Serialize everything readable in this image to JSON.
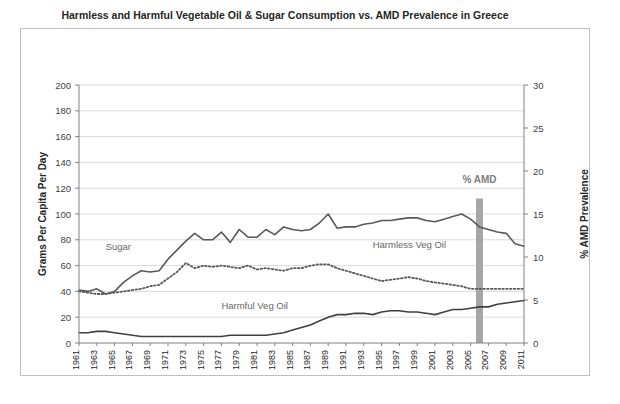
{
  "chart_data": {
    "type": "line",
    "title": "Harmless and Harmful Vegetable Oil & Sugar Consumption vs. AMD Prevalence in Greece",
    "xlabel": "",
    "ylabel": "Grams Per Capita Per Day",
    "y2label": "% AMD Prevalence",
    "ylim": [
      0,
      200
    ],
    "y2lim": [
      0,
      30
    ],
    "yticks": [
      0,
      20,
      40,
      60,
      80,
      100,
      120,
      140,
      160,
      180,
      200
    ],
    "y2ticks": [
      0,
      5,
      10,
      15,
      20,
      25,
      30
    ],
    "grid": true,
    "legend_position": "inline-annotations",
    "x": [
      1961,
      1962,
      1963,
      1964,
      1965,
      1966,
      1967,
      1968,
      1969,
      1970,
      1971,
      1972,
      1973,
      1974,
      1975,
      1976,
      1977,
      1978,
      1979,
      1980,
      1981,
      1982,
      1983,
      1984,
      1985,
      1986,
      1987,
      1988,
      1989,
      1990,
      1991,
      1992,
      1993,
      1994,
      1995,
      1996,
      1997,
      1998,
      1999,
      2000,
      2001,
      2002,
      2003,
      2004,
      2005,
      2006,
      2007,
      2008,
      2009,
      2010,
      2011
    ],
    "xtick_labels": [
      "1961",
      "1963",
      "1965",
      "1967",
      "1969",
      "1971",
      "1973",
      "1975",
      "1977",
      "1979",
      "1981",
      "1983",
      "1985",
      "1987",
      "1989",
      "1991",
      "1993",
      "1995",
      "1997",
      "1999",
      "2001",
      "2003",
      "2005",
      "2007",
      "2009",
      "2011"
    ],
    "series": [
      {
        "name": "Sugar",
        "style": "solid",
        "color": "#595959",
        "axis": "left",
        "values": [
          41,
          40,
          42,
          38,
          40,
          47,
          52,
          56,
          55,
          56,
          65,
          72,
          79,
          85,
          80,
          80,
          86,
          78,
          88,
          82,
          82,
          88,
          84,
          90,
          88,
          87,
          88,
          93,
          100,
          89,
          90,
          90,
          92,
          93,
          95,
          95,
          96,
          97,
          97,
          95,
          94,
          96,
          98,
          100,
          96,
          90,
          88,
          86,
          85,
          77,
          75
        ]
      },
      {
        "name": "Harmful Veg Oil",
        "style": "dotted",
        "color": "#595959",
        "axis": "left",
        "values": [
          40,
          39,
          38,
          38,
          39,
          40,
          41,
          42,
          44,
          45,
          50,
          55,
          62,
          58,
          60,
          59,
          60,
          59,
          58,
          60,
          57,
          58,
          57,
          56,
          58,
          58,
          60,
          61,
          61,
          58,
          56,
          54,
          52,
          50,
          48,
          49,
          50,
          51,
          50,
          48,
          47,
          46,
          45,
          44,
          42,
          42,
          42,
          42,
          42,
          42,
          42
        ]
      },
      {
        "name": "Harmless Veg Oil",
        "style": "solid",
        "color": "#404040",
        "axis": "left",
        "values": [
          8,
          8,
          9,
          9,
          8,
          7,
          6,
          5,
          5,
          5,
          5,
          5,
          5,
          5,
          5,
          5,
          5,
          6,
          6,
          6,
          6,
          6,
          7,
          8,
          10,
          12,
          14,
          17,
          20,
          22,
          22,
          23,
          23,
          22,
          24,
          25,
          25,
          24,
          24,
          23,
          22,
          24,
          26,
          26,
          27,
          28,
          28,
          30,
          31,
          32,
          33
        ]
      }
    ],
    "annotations": [
      {
        "name": "sugar-label",
        "text": "Sugar",
        "x": 1964,
        "y": 72
      },
      {
        "name": "harmful-veg-oil-label",
        "text": "Harmful Veg Oil",
        "x": 1977,
        "y": 26
      },
      {
        "name": "harmless-veg-oil-label",
        "text": "Harmless Veg Oil",
        "x": 1994,
        "y": 74
      },
      {
        "name": "amd-marker-label",
        "text": "% AMD",
        "x": 2006,
        "y": 124
      }
    ],
    "markers": [
      {
        "name": "amd-prevalence-bar",
        "type": "vertical-bar",
        "x": 2006,
        "value_top": 112,
        "color": "#a6a6a6"
      }
    ]
  }
}
